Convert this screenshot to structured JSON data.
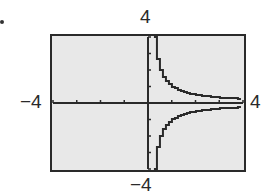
{
  "chart_data": {
    "type": "line",
    "title": "",
    "function": "y = 1/x",
    "xlabel": "",
    "ylabel": "",
    "xlim": [
      -4,
      4
    ],
    "ylim": [
      -4,
      4
    ],
    "x_tick_step": 1,
    "y_tick_step": 1,
    "grid": false,
    "window_labels": {
      "xmin": "−4",
      "xmax": "4",
      "ymin": "−4",
      "ymax": "4"
    },
    "series": [
      {
        "name": "y = 1/x (x > 0)",
        "x": [
          0.25,
          0.3,
          0.4,
          0.5,
          0.75,
          1,
          1.5,
          2,
          2.5,
          3,
          3.5,
          4
        ],
        "y": [
          4,
          3.33,
          2.5,
          2,
          1.33,
          1,
          0.67,
          0.5,
          0.4,
          0.33,
          0.29,
          0.25
        ]
      },
      {
        "name": "y = 1/x (x < 0 mirrored region shown as reflection)",
        "x": [
          0.25,
          0.3,
          0.4,
          0.5,
          0.75,
          1,
          1.5,
          2,
          2.5,
          3,
          3.5,
          4
        ],
        "y": [
          -4,
          -3.33,
          -2.5,
          -2,
          -1.33,
          -1,
          -0.67,
          -0.5,
          -0.4,
          -0.33,
          -0.29,
          -0.25
        ]
      }
    ]
  },
  "colors": {
    "screen_bg": "#e8e8e8",
    "ink": "#2a2a2a"
  }
}
